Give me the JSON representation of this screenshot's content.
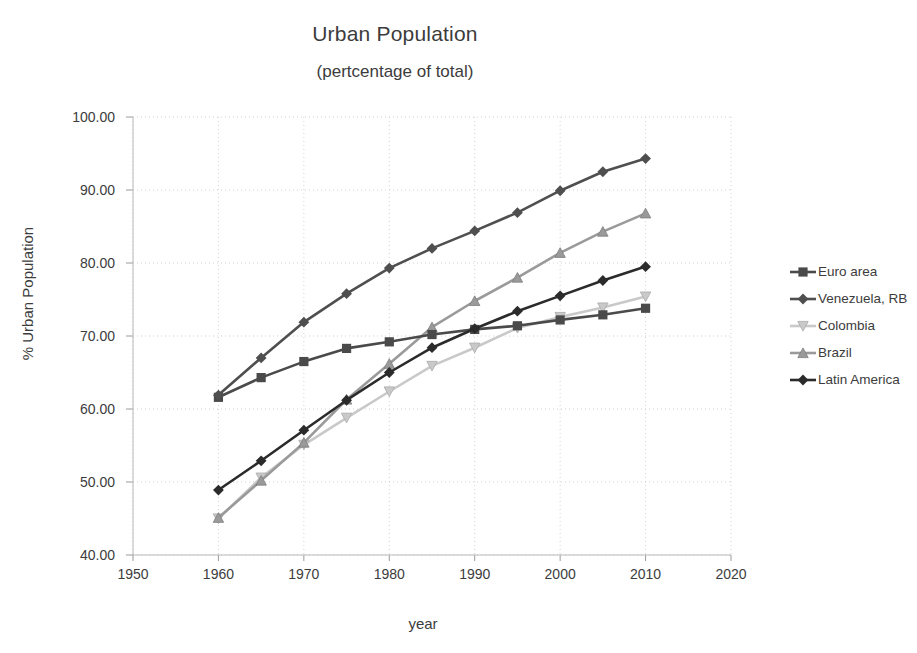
{
  "chart_data": {
    "type": "line",
    "title": "Urban Population",
    "subtitle": "(pertcentage of  total)",
    "xlabel": "year",
    "ylabel": "% Urban Population",
    "xlim": [
      1950,
      2020
    ],
    "ylim": [
      40,
      100
    ],
    "xticks": [
      "1950",
      "1960",
      "1970",
      "1980",
      "1990",
      "2000",
      "2010",
      "2020"
    ],
    "yticks": [
      "40.00",
      "50.00",
      "60.00",
      "70.00",
      "80.00",
      "90.00",
      "100.00"
    ],
    "grid": true,
    "legend_position": "right",
    "x": [
      1960,
      1965,
      1970,
      1975,
      1980,
      1985,
      1990,
      1995,
      2000,
      2005,
      2010
    ],
    "series": [
      {
        "name": "Euro area",
        "color": "#4a4a4a",
        "marker": "square",
        "values": [
          61.6,
          64.3,
          66.5,
          68.3,
          69.2,
          70.2,
          70.9,
          71.4,
          72.2,
          72.9,
          73.8
        ]
      },
      {
        "name": "Venezuela, RB",
        "color": "#4f4f4f",
        "marker": "diamond",
        "values": [
          61.9,
          67.0,
          71.9,
          75.8,
          79.3,
          82.0,
          84.4,
          86.9,
          89.9,
          92.5,
          94.3
        ]
      },
      {
        "name": "Colombia",
        "color": "#c9c9c9",
        "marker": "triangle-down",
        "values": [
          45.0,
          50.6,
          55.1,
          58.8,
          62.4,
          65.9,
          68.4,
          71.1,
          72.6,
          73.9,
          75.4
        ]
      },
      {
        "name": "Brazil",
        "color": "#9a9a9a",
        "marker": "triangle-up",
        "values": [
          45.1,
          50.2,
          55.4,
          61.3,
          66.2,
          71.2,
          74.8,
          78.0,
          81.4,
          84.3,
          86.8
        ]
      },
      {
        "name": "Latin America",
        "color": "#2b2b2b",
        "marker": "diamond",
        "values": [
          48.9,
          52.9,
          57.1,
          61.2,
          65.0,
          68.4,
          71.0,
          73.4,
          75.5,
          77.6,
          79.5
        ]
      }
    ]
  },
  "legend": {
    "items": [
      {
        "label": "Euro area"
      },
      {
        "label": "Venezuela, RB"
      },
      {
        "label": "Colombia"
      },
      {
        "label": "Brazil"
      },
      {
        "label": "Latin America"
      }
    ]
  }
}
